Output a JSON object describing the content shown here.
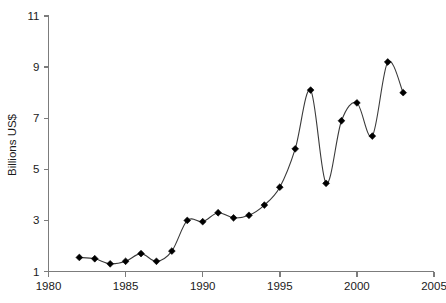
{
  "chart_data": {
    "type": "line",
    "title": "",
    "subtitle": "",
    "xlabel": "",
    "ylabel": "Billions US$",
    "xlim": [
      1980,
      2005
    ],
    "ylim": [
      1,
      11
    ],
    "xticks": [
      1980,
      1985,
      1990,
      1995,
      2000,
      2005
    ],
    "yticks": [
      1,
      3,
      5,
      7,
      9,
      11
    ],
    "xtick_labels": [
      "1980",
      "1985",
      "1990",
      "1995",
      "2000",
      "2005"
    ],
    "ytick_labels": [
      "1",
      "3",
      "5",
      "7",
      "9",
      "11"
    ],
    "grid": false,
    "legend": null,
    "legend_position": "none",
    "marker": "diamond",
    "line_color": "#3a3a3a",
    "marker_color": "#000000",
    "axis_color": "#7c7c7c",
    "x": [
      1982,
      1983,
      1984,
      1985,
      1986,
      1987,
      1988,
      1989,
      1990,
      1991,
      1992,
      1993,
      1994,
      1995,
      1996,
      1997,
      1998,
      1999,
      2000,
      2001,
      2002,
      2003
    ],
    "values": [
      1.55,
      1.5,
      1.3,
      1.4,
      1.7,
      1.4,
      1.8,
      3.0,
      2.95,
      3.3,
      3.1,
      3.2,
      3.6,
      4.3,
      5.8,
      8.1,
      4.45,
      6.9,
      7.6,
      6.3,
      9.2,
      8.0
    ],
    "series": [
      {
        "name": "Billions US$",
        "x": [
          1982,
          1983,
          1984,
          1985,
          1986,
          1987,
          1988,
          1989,
          1990,
          1991,
          1992,
          1993,
          1994,
          1995,
          1996,
          1997,
          1998,
          1999,
          2000,
          2001,
          2002,
          2003
        ],
        "values": [
          1.55,
          1.5,
          1.3,
          1.4,
          1.7,
          1.4,
          1.8,
          3.0,
          2.95,
          3.3,
          3.1,
          3.2,
          3.6,
          4.3,
          5.8,
          8.1,
          4.45,
          6.9,
          7.6,
          6.3,
          9.2,
          8.0
        ]
      }
    ],
    "annotations": []
  },
  "axes": {
    "y_title": "Billions US$"
  }
}
